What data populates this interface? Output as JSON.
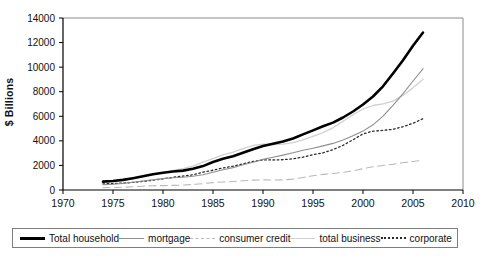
{
  "chart_data": {
    "type": "line",
    "title": "",
    "xlabel": "",
    "ylabel": "$ Billions",
    "x_range": [
      1970,
      2010
    ],
    "y_range": [
      0,
      14000
    ],
    "x_ticks": [
      1970,
      1975,
      1980,
      1985,
      1990,
      1995,
      2000,
      2005,
      2010
    ],
    "y_ticks": [
      0,
      2000,
      4000,
      6000,
      8000,
      10000,
      12000,
      14000
    ],
    "grid": "off",
    "legend_position": "bottom",
    "years": [
      1974,
      1975,
      1976,
      1977,
      1978,
      1979,
      1980,
      1981,
      1982,
      1983,
      1984,
      1985,
      1986,
      1987,
      1988,
      1989,
      1990,
      1991,
      1992,
      1993,
      1994,
      1995,
      1996,
      1997,
      1998,
      1999,
      2000,
      2001,
      2002,
      2003,
      2004,
      2005,
      2006
    ],
    "series": [
      {
        "name": "Total household",
        "color": "#000000",
        "width": 2.6,
        "line_style": "solid",
        "values": [
          680,
          734,
          826,
          961,
          1114,
          1276,
          1396,
          1506,
          1576,
          1731,
          1943,
          2278,
          2536,
          2754,
          3040,
          3319,
          3578,
          3768,
          3954,
          4190,
          4528,
          4851,
          5181,
          5489,
          5903,
          6393,
          6960,
          7614,
          8439,
          9479,
          10558,
          11742,
          12817
        ]
      },
      {
        "name": "mortgage",
        "color": "#8f8f8f",
        "width": 1.1,
        "line_style": "solid",
        "values": [
          440,
          475,
          535,
          625,
          730,
          840,
          926,
          998,
          1031,
          1116,
          1242,
          1449,
          1648,
          1827,
          2054,
          2258,
          2489,
          2667,
          2840,
          3030,
          3235,
          3403,
          3593,
          3795,
          4066,
          4422,
          4798,
          5305,
          6010,
          6894,
          7835,
          8874,
          9865
        ]
      },
      {
        "name": "consumer credit",
        "color": "#b9b9b9",
        "width": 1.1,
        "line_style": "dashed",
        "values": [
          190,
          204,
          226,
          260,
          306,
          348,
          358,
          378,
          396,
          444,
          517,
          599,
          655,
          693,
          745,
          809,
          824,
          815,
          824,
          886,
          1021,
          1168,
          1273,
          1344,
          1441,
          1556,
          1741,
          1891,
          1997,
          2103,
          2220,
          2321,
          2416
        ]
      },
      {
        "name": "total business",
        "color": "#d0d0d0",
        "width": 1.3,
        "line_style": "solid",
        "values": [
          745,
          775,
          840,
          950,
          1090,
          1255,
          1420,
          1600,
          1740,
          1940,
          2270,
          2550,
          2860,
          3080,
          3370,
          3620,
          3735,
          3700,
          3740,
          3850,
          4080,
          4370,
          4670,
          5060,
          5590,
          6130,
          6590,
          6880,
          7010,
          7240,
          7700,
          8320,
          9020
        ]
      },
      {
        "name": "corporate",
        "color": "#2a2a2a",
        "width": 1.3,
        "line_style": "dotted",
        "values": [
          495,
          520,
          560,
          620,
          700,
          800,
          915,
          1030,
          1130,
          1240,
          1450,
          1610,
          1800,
          1940,
          2130,
          2330,
          2450,
          2440,
          2470,
          2540,
          2670,
          2870,
          3030,
          3280,
          3640,
          4090,
          4570,
          4790,
          4850,
          4940,
          5150,
          5430,
          5800
        ]
      }
    ]
  },
  "axis_colors": {
    "axis_line": "#000000",
    "plot_border": "#8a8a8a",
    "tick_label": "#111111"
  }
}
